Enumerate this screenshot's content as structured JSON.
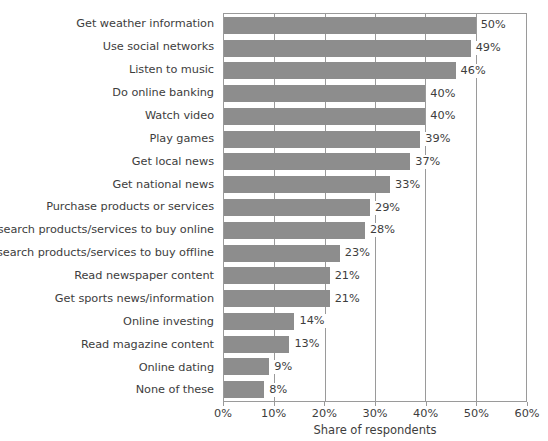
{
  "chart_data": {
    "type": "bar",
    "orientation": "horizontal",
    "title": "",
    "subtitle": "",
    "xlabel": "Share of respondents",
    "ylabel": "",
    "xlim": [
      0,
      60
    ],
    "xticks": [
      "0%",
      "10%",
      "20%",
      "30%",
      "40%",
      "50%",
      "60%"
    ],
    "xtick_values": [
      0,
      10,
      20,
      30,
      40,
      50,
      60
    ],
    "grid": true,
    "legend": null,
    "legend_position": "none",
    "value_suffix": "%",
    "bar_color": "#8d8d8d",
    "axis_color": "#9a9a9a",
    "text_color": "#3d3d3d",
    "categories": [
      "Get weather information",
      "Use social networks",
      "Listen to music",
      "Do online banking",
      "Watch video",
      "Play games",
      "Get local news",
      "Get national news",
      "Purchase products or services",
      "Research products/services to buy online",
      "Research products/services to buy offline",
      "Read newspaper content",
      "Get sports news/information",
      "Online investing",
      "Read magazine content",
      "Online dating",
      "None of these"
    ],
    "values": [
      50,
      49,
      46,
      40,
      40,
      39,
      37,
      33,
      29,
      28,
      23,
      21,
      21,
      14,
      13,
      9,
      8
    ],
    "value_labels": [
      "50%",
      "49%",
      "46%",
      "40%",
      "40%",
      "39%",
      "37%",
      "33%",
      "29%",
      "28%",
      "23%",
      "21%",
      "21%",
      "14%",
      "13%",
      "9%",
      "8%"
    ]
  }
}
